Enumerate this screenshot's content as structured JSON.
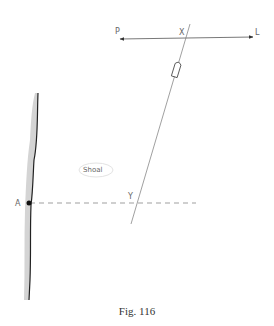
{
  "labels": {
    "p": "P",
    "l": "L",
    "x": "X",
    "y": "Y",
    "a": "A",
    "shoal": "Shoal"
  },
  "caption": "Fig. 116"
}
